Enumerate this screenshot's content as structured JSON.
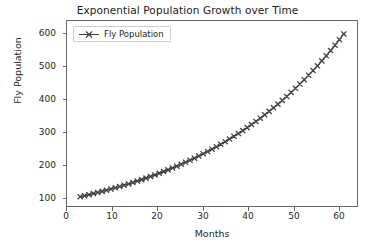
{
  "chart_data": {
    "type": "line",
    "title": "Exponential Population Growth over Time",
    "xlabel": "Months",
    "ylabel": "Fly Population",
    "legend": [
      {
        "name": "Fly Population",
        "color": "#404040",
        "marker": "x",
        "linestyle": "solid"
      }
    ],
    "legend_position": "upper left",
    "grid": false,
    "xlim": [
      -2.0,
      64.0
    ],
    "ylim": [
      72.0,
      628.0
    ],
    "xticks": [
      0,
      10,
      20,
      30,
      40,
      50,
      60
    ],
    "yticks": [
      100,
      200,
      300,
      400,
      500,
      600
    ],
    "xtick_labels": [
      "0",
      "10",
      "20",
      "30",
      "40",
      "50",
      "60"
    ],
    "ytick_labels": [
      "100",
      "200",
      "300",
      "400",
      "500",
      "600"
    ],
    "series": [
      {
        "name": "Fly Population",
        "x": [
          1,
          2,
          3,
          4,
          5,
          6,
          7,
          8,
          9,
          10,
          11,
          12,
          13,
          14,
          15,
          16,
          17,
          18,
          19,
          20,
          21,
          22,
          23,
          24,
          25,
          26,
          27,
          28,
          29,
          30,
          31,
          32,
          33,
          34,
          35,
          36,
          37,
          38,
          39,
          40,
          41,
          42,
          43,
          44,
          45,
          46,
          47,
          48,
          49,
          50,
          51,
          52,
          53,
          54,
          55,
          56,
          57,
          58,
          59,
          60,
          61
        ],
        "values": [
          100.0,
          103.0,
          106.1,
          109.3,
          112.6,
          115.9,
          119.4,
          123.0,
          126.7,
          130.5,
          134.4,
          138.4,
          142.6,
          146.9,
          151.3,
          155.8,
          160.5,
          165.3,
          170.2,
          175.4,
          180.6,
          186.0,
          191.6,
          197.4,
          203.3,
          209.4,
          215.7,
          222.1,
          228.8,
          235.7,
          242.7,
          250.0,
          257.5,
          265.2,
          273.2,
          281.4,
          289.8,
          298.5,
          307.5,
          316.7,
          326.2,
          336.0,
          346.0,
          356.4,
          367.1,
          378.2,
          389.5,
          401.2,
          413.2,
          425.6,
          438.4,
          451.5,
          465.1,
          479.0,
          493.4,
          508.2,
          523.4,
          539.1,
          555.3,
          571.9,
          589.1
        ]
      }
    ]
  },
  "axes": {
    "title": "Exponential Population Growth over Time",
    "xlabel": "Months",
    "ylabel": "Fly Population"
  },
  "legend": {
    "label": "Fly Population"
  },
  "ticks": {
    "y": [
      "600",
      "500",
      "400",
      "300",
      "200",
      "100"
    ],
    "x": [
      "0",
      "10",
      "20",
      "30",
      "40",
      "50",
      "60"
    ]
  }
}
